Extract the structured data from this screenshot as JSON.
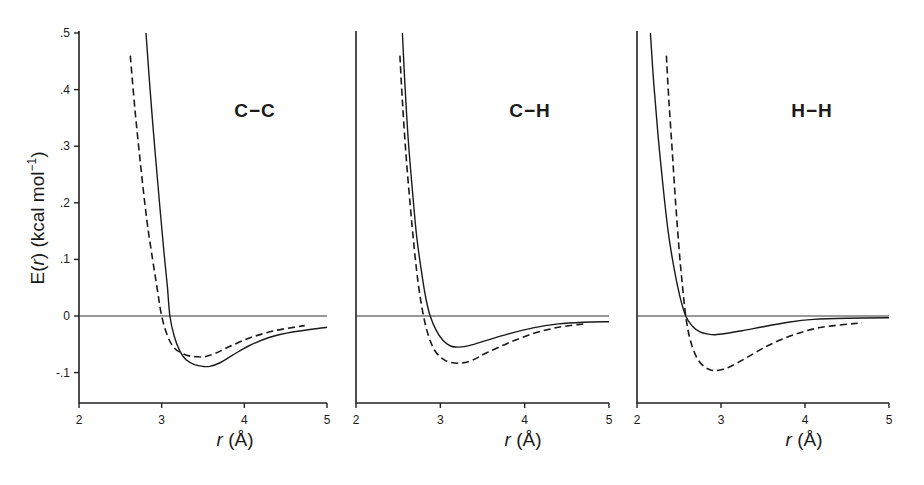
{
  "figure": {
    "ylabel_main": "E(",
    "ylabel_r": "r",
    "ylabel_rest": ") (kcal mol",
    "ylabel_sup": "−1",
    "ylabel_close": ")",
    "xlabel_r": "r",
    "xlabel_unit": " (Å)"
  },
  "chart_data": [
    {
      "type": "line",
      "title": "C−C",
      "xlabel": "r (Å)",
      "ylabel": "E(r) (kcal mol⁻¹)",
      "xlim": [
        2,
        5
      ],
      "ylim": [
        -0.15,
        0.5
      ],
      "xticks": [
        "2",
        "3",
        "4",
        "5"
      ],
      "yticks": [
        ".5",
        ".4",
        ".3",
        ".2",
        ".1",
        "0",
        "-.1"
      ],
      "ytick_values": [
        0.5,
        0.4,
        0.3,
        0.2,
        0.1,
        0,
        -0.1
      ],
      "grid": false,
      "reference_line": 0,
      "series": [
        {
          "name": "solid",
          "style": "solid",
          "x": [
            2.81,
            2.86,
            2.92,
            2.98,
            3.03,
            3.07,
            3.1,
            3.15,
            3.22,
            3.3,
            3.4,
            3.5,
            3.58,
            3.7,
            3.85,
            4.05,
            4.3,
            4.6,
            5.0
          ],
          "y": [
            0.5,
            0.4,
            0.29,
            0.19,
            0.11,
            0.05,
            0.0,
            -0.035,
            -0.062,
            -0.078,
            -0.086,
            -0.089,
            -0.089,
            -0.083,
            -0.07,
            -0.053,
            -0.038,
            -0.028,
            -0.02
          ]
        },
        {
          "name": "dashed",
          "style": "dashed",
          "x": [
            2.62,
            2.68,
            2.75,
            2.82,
            2.89,
            2.95,
            3.0,
            3.07,
            3.15,
            3.25,
            3.35,
            3.45,
            3.52,
            3.65,
            3.85,
            4.1,
            4.4,
            4.73
          ],
          "y": [
            0.46,
            0.36,
            0.26,
            0.17,
            0.1,
            0.045,
            0.0,
            -0.035,
            -0.056,
            -0.066,
            -0.071,
            -0.072,
            -0.072,
            -0.066,
            -0.052,
            -0.037,
            -0.025,
            -0.017
          ]
        }
      ]
    },
    {
      "type": "line",
      "title": "C−H",
      "xlabel": "r (Å)",
      "xlim": [
        2,
        5
      ],
      "ylim": [
        -0.15,
        0.5
      ],
      "xticks": [
        "2",
        "3",
        "4",
        "5"
      ],
      "grid": false,
      "reference_line": 0,
      "series": [
        {
          "name": "solid",
          "style": "solid",
          "x": [
            2.55,
            2.58,
            2.62,
            2.67,
            2.72,
            2.78,
            2.83,
            2.88,
            2.95,
            3.03,
            3.12,
            3.22,
            3.35,
            3.55,
            3.8,
            4.1,
            4.4,
            4.7,
            5.0
          ],
          "y": [
            0.5,
            0.41,
            0.31,
            0.22,
            0.14,
            0.075,
            0.03,
            0.0,
            -0.025,
            -0.043,
            -0.053,
            -0.055,
            -0.052,
            -0.043,
            -0.032,
            -0.021,
            -0.014,
            -0.011,
            -0.01
          ]
        },
        {
          "name": "dashed",
          "style": "dashed",
          "x": [
            2.52,
            2.55,
            2.59,
            2.64,
            2.69,
            2.74,
            2.8,
            2.86,
            2.93,
            3.02,
            3.12,
            3.25,
            3.38,
            3.55,
            3.8,
            4.1,
            4.4,
            4.7
          ],
          "y": [
            0.46,
            0.38,
            0.29,
            0.2,
            0.12,
            0.055,
            0.0,
            -0.035,
            -0.06,
            -0.075,
            -0.082,
            -0.083,
            -0.078,
            -0.065,
            -0.048,
            -0.031,
            -0.02,
            -0.014
          ]
        }
      ]
    },
    {
      "type": "line",
      "title": "H−H",
      "xlabel": "r (Å)",
      "xlim": [
        2,
        5
      ],
      "ylim": [
        -0.15,
        0.5
      ],
      "xticks": [
        "2",
        "3",
        "4",
        "5"
      ],
      "grid": false,
      "reference_line": 0,
      "series": [
        {
          "name": "solid",
          "style": "solid",
          "x": [
            2.16,
            2.2,
            2.25,
            2.31,
            2.37,
            2.44,
            2.51,
            2.58,
            2.66,
            2.75,
            2.85,
            2.93,
            3.05,
            3.25,
            3.5,
            3.8,
            4.1,
            4.5,
            5.0
          ],
          "y": [
            0.5,
            0.41,
            0.32,
            0.23,
            0.15,
            0.085,
            0.035,
            0.0,
            -0.018,
            -0.028,
            -0.032,
            -0.033,
            -0.031,
            -0.026,
            -0.019,
            -0.011,
            -0.006,
            -0.004,
            -0.003
          ]
        },
        {
          "name": "dashed",
          "style": "dashed",
          "x": [
            2.35,
            2.38,
            2.42,
            2.46,
            2.5,
            2.54,
            2.58,
            2.63,
            2.7,
            2.78,
            2.87,
            2.97,
            3.1,
            3.3,
            3.55,
            3.85,
            4.2,
            4.68
          ],
          "y": [
            0.46,
            0.38,
            0.29,
            0.2,
            0.12,
            0.055,
            0.0,
            -0.04,
            -0.07,
            -0.087,
            -0.095,
            -0.096,
            -0.09,
            -0.074,
            -0.053,
            -0.034,
            -0.02,
            -0.012
          ]
        }
      ]
    }
  ]
}
